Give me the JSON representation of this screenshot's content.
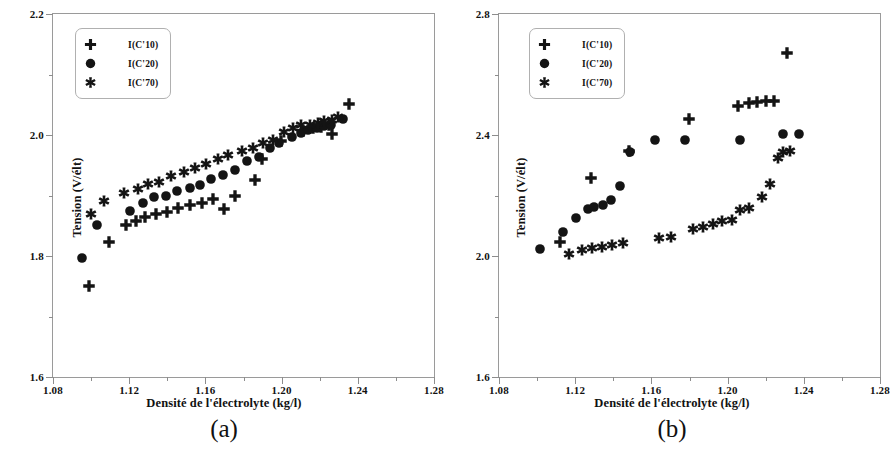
{
  "figure": {
    "panels": [
      {
        "id": "a",
        "caption": "(a)",
        "xlabel": "Densité de l'électrolyte (kg/l)",
        "ylabel": "Tension (V/élt)"
      },
      {
        "id": "b",
        "caption": "(b)",
        "xlabel": "Densité de l'électrolyte (kg/l)",
        "ylabel": "Tension (V/élt)"
      }
    ],
    "legend": {
      "items": [
        {
          "label": "I(C'10)",
          "marker": "plus-marker"
        },
        {
          "label": "I(C'20)",
          "marker": "circle-marker"
        },
        {
          "label": "I(C'70)",
          "marker": "star-marker"
        }
      ]
    },
    "colors": {
      "marker": "#141414",
      "frame": "#9a9a9a",
      "background": "#ffffff"
    }
  },
  "chart_data": [
    {
      "type": "scatter",
      "title": "(a)",
      "xlabel": "Densité de l'électrolyte (kg/l)",
      "ylabel": "Tension (V/élt)",
      "xlim": [
        1.08,
        1.28
      ],
      "ylim": [
        1.6,
        2.2
      ],
      "xticks": [
        1.08,
        1.12,
        1.16,
        1.2,
        1.24,
        1.28
      ],
      "xticklabels": [
        "1.08",
        "1.12",
        "1.16",
        "1.20",
        "1.24",
        "1.28"
      ],
      "yticks": [
        1.6,
        1.8,
        2.0,
        2.2
      ],
      "yticklabels": [
        "1.6",
        "1.8",
        "2.0",
        "2.2"
      ],
      "xminorticks": [
        1.1,
        1.14,
        1.18,
        1.22,
        1.26
      ],
      "yminorticks": [
        1.7,
        1.9,
        2.1
      ],
      "grid": false,
      "legend_position": "upper left",
      "series": [
        {
          "name": "I(C'10)",
          "marker": "plus",
          "points": [
            [
              1.099,
              1.751
            ],
            [
              1.1095,
              1.8225
            ],
            [
              1.1185,
              1.852
            ],
            [
              1.1235,
              1.858
            ],
            [
              1.1285,
              1.8645
            ],
            [
              1.134,
              1.869
            ],
            [
              1.14,
              1.873
            ],
            [
              1.1455,
              1.879
            ],
            [
              1.152,
              1.8845
            ],
            [
              1.158,
              1.888
            ],
            [
              1.164,
              1.894
            ],
            [
              1.17,
              1.878
            ],
            [
              1.1755,
              1.899
            ],
            [
              1.186,
              1.925
            ],
            [
              1.1895,
              1.9605
            ],
            [
              1.1995,
              1.9905
            ],
            [
              1.211,
              2.007
            ],
            [
              1.2165,
              2.0115
            ],
            [
              1.2205,
              2.0135
            ],
            [
              1.225,
              2.0165
            ],
            [
              1.2265,
              2.002
            ],
            [
              1.2355,
              2.051
            ]
          ]
        },
        {
          "name": "I(C'20)",
          "marker": "circle",
          "points": [
            [
              1.095,
              1.7975
            ],
            [
              1.103,
              1.851
            ],
            [
              1.1205,
              1.875
            ],
            [
              1.127,
              1.8875
            ],
            [
              1.133,
              1.897
            ],
            [
              1.1395,
              1.8985
            ],
            [
              1.145,
              1.907
            ],
            [
              1.152,
              1.9125
            ],
            [
              1.157,
              1.9175
            ],
            [
              1.163,
              1.927
            ],
            [
              1.169,
              1.9335
            ],
            [
              1.1755,
              1.9415
            ],
            [
              1.182,
              1.957
            ],
            [
              1.188,
              1.964
            ],
            [
              1.194,
              1.978
            ],
            [
              1.1985,
              1.987
            ],
            [
              1.2055,
              1.9975
            ],
            [
              1.21,
              2.0025
            ],
            [
              1.214,
              2.0075
            ],
            [
              1.2185,
              2.011
            ],
            [
              1.2225,
              2.0155
            ],
            [
              1.226,
              2.017
            ],
            [
              1.232,
              2.026
            ]
          ]
        },
        {
          "name": "I(C'70)",
          "marker": "star",
          "points": [
            [
              1.1,
              1.8695
            ],
            [
              1.107,
              1.891
            ],
            [
              1.1175,
              1.904
            ],
            [
              1.1245,
              1.9105
            ],
            [
              1.13,
              1.9195
            ],
            [
              1.1355,
              1.923
            ],
            [
              1.142,
              1.932
            ],
            [
              1.149,
              1.9395
            ],
            [
              1.1545,
              1.945
            ],
            [
              1.1605,
              1.952
            ],
            [
              1.1665,
              1.96
            ],
            [
              1.172,
              1.9665
            ],
            [
              1.179,
              1.974
            ],
            [
              1.185,
              1.979
            ],
            [
              1.19,
              1.986
            ],
            [
              1.1955,
              1.991
            ],
            [
              1.201,
              2.005
            ],
            [
              1.206,
              2.012
            ],
            [
              1.21,
              2.016
            ],
            [
              1.215,
              2.0165
            ],
            [
              1.219,
              2.02
            ],
            [
              1.2225,
              2.023
            ],
            [
              1.2265,
              2.0255
            ],
            [
              1.2295,
              2.03
            ]
          ]
        }
      ]
    },
    {
      "type": "scatter",
      "title": "(b)",
      "xlabel": "Densité de l'électrolyte (kg/l)",
      "ylabel": "Tension (V/élt)",
      "xlim": [
        1.08,
        1.28
      ],
      "ylim": [
        1.6,
        2.8
      ],
      "xticks": [
        1.08,
        1.12,
        1.16,
        1.2,
        1.24,
        1.28
      ],
      "xticklabels": [
        "1.08",
        "1.12",
        "1.16",
        "1.20",
        "1.24",
        "1.28"
      ],
      "yticks": [
        1.6,
        2.0,
        2.4,
        2.8
      ],
      "yticklabels": [
        "1.6",
        "2.0",
        "2.4",
        "2.8"
      ],
      "xminorticks": [
        1.1,
        1.14,
        1.18,
        1.22,
        1.26
      ],
      "yminorticks": [
        1.8,
        2.2,
        2.6
      ],
      "grid": false,
      "legend_position": "upper left",
      "series": [
        {
          "name": "I(C'10)",
          "marker": "plus",
          "points": [
            [
              1.112,
              2.045
            ],
            [
              1.1285,
              2.258
            ],
            [
              1.148,
              2.348
            ],
            [
              1.1795,
              2.452
            ],
            [
              1.2055,
              2.496
            ],
            [
              1.211,
              2.507
            ],
            [
              1.2155,
              2.509
            ],
            [
              1.22,
              2.512
            ],
            [
              1.2245,
              2.514
            ],
            [
              1.231,
              2.67
            ]
          ]
        },
        {
          "name": "I(C'20)",
          "marker": "circle",
          "points": [
            [
              1.1015,
              2.024
            ],
            [
              1.1135,
              2.078
            ],
            [
              1.1205,
              2.127
            ],
            [
              1.1265,
              2.156
            ],
            [
              1.13,
              2.162
            ],
            [
              1.1345,
              2.168
            ],
            [
              1.139,
              2.184
            ],
            [
              1.1435,
              2.231
            ],
            [
              1.149,
              2.3425
            ],
            [
              1.162,
              2.383
            ],
            [
              1.1775,
              2.383
            ],
            [
              1.2065,
              2.385
            ],
            [
              1.229,
              2.404
            ],
            [
              1.2375,
              2.402
            ]
          ]
        },
        {
          "name": "I(C'70)",
          "marker": "star",
          "points": [
            [
              1.117,
              2.008
            ],
            [
              1.1235,
              2.019
            ],
            [
              1.129,
              2.025
            ],
            [
              1.134,
              2.031
            ],
            [
              1.1395,
              2.036
            ],
            [
              1.145,
              2.042
            ],
            [
              1.164,
              2.058
            ],
            [
              1.1705,
              2.064
            ],
            [
              1.182,
              2.088
            ],
            [
              1.187,
              2.096
            ],
            [
              1.1925,
              2.106
            ],
            [
              1.197,
              2.115
            ],
            [
              1.2025,
              2.12
            ],
            [
              1.2065,
              2.151
            ],
            [
              1.211,
              2.16
            ],
            [
              1.218,
              2.194
            ],
            [
              1.2225,
              2.239
            ],
            [
              1.2265,
              2.325
            ],
            [
              1.229,
              2.344
            ],
            [
              1.233,
              2.347
            ]
          ]
        }
      ]
    }
  ]
}
